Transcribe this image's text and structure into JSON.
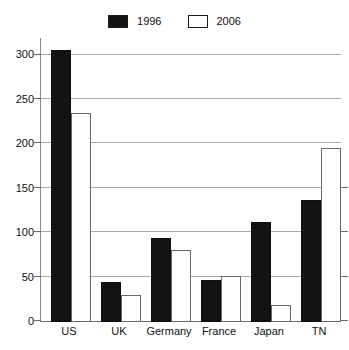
{
  "legend": {
    "entries": [
      {
        "label": "1996",
        "swatch": "filled",
        "color": "#131313"
      },
      {
        "label": "2006",
        "swatch": "hollow",
        "color": "#ffffff"
      }
    ]
  },
  "axis": {
    "y_ticks": [
      "0",
      "50",
      "100",
      "150",
      "200",
      "250",
      "300"
    ],
    "x_ticks": [
      "US",
      "UK",
      "Germany",
      "France",
      "Japan",
      "TN"
    ]
  },
  "chart_data": {
    "type": "bar",
    "title": "",
    "xlabel": "",
    "ylabel": "",
    "ylim": [
      0,
      320
    ],
    "yticks": [
      0,
      50,
      100,
      150,
      200,
      250,
      300
    ],
    "grid": true,
    "legend_position": "top-center",
    "categories": [
      "US",
      "UK",
      "Germany",
      "France",
      "Japan",
      "TN"
    ],
    "series": [
      {
        "name": "1996",
        "color": "#131313",
        "values": [
          307,
          45,
          95,
          47,
          113,
          138
        ]
      },
      {
        "name": "2006",
        "color": "#ffffff",
        "values": [
          235,
          30,
          81,
          52,
          19,
          196
        ]
      }
    ]
  }
}
